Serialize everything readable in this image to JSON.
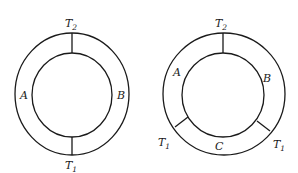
{
  "figures": [
    {
      "name": "left",
      "labels": {
        "top": {
          "main": "T",
          "sub": "2"
        },
        "bottom": {
          "main": "T",
          "sub": "1"
        },
        "left": "A",
        "right": "B"
      }
    },
    {
      "name": "right",
      "labels": {
        "top": {
          "main": "T",
          "sub": "2"
        },
        "bottom_left": {
          "main": "T",
          "sub": "1"
        },
        "bottom_right": {
          "main": "T",
          "sub": "1"
        },
        "left": "A",
        "right": "B",
        "bottom": "C"
      }
    }
  ]
}
